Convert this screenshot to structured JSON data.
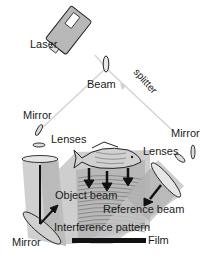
{
  "diagram": {
    "labels": {
      "laser": "Laser",
      "beam": "Beam",
      "splitter": "splitter",
      "mirror_left_top": "Mirror",
      "lenses_left": "Lenses",
      "mirror_right": "Mirror",
      "lenses_right": "Lenses",
      "object_beam": "Object beam",
      "reference_beam": "Reference beam",
      "interference_pattern": "Interference pattern",
      "mirror_bottom": "Mirror",
      "film": "Film"
    },
    "colors": {
      "beam_line": "#cfcfcf",
      "beam_fill": "#bdbdbd",
      "beam_fill_dark": "#9e9e9e",
      "outline": "#222222",
      "laser_body": "#b5b5b5",
      "film": "#111111"
    }
  }
}
